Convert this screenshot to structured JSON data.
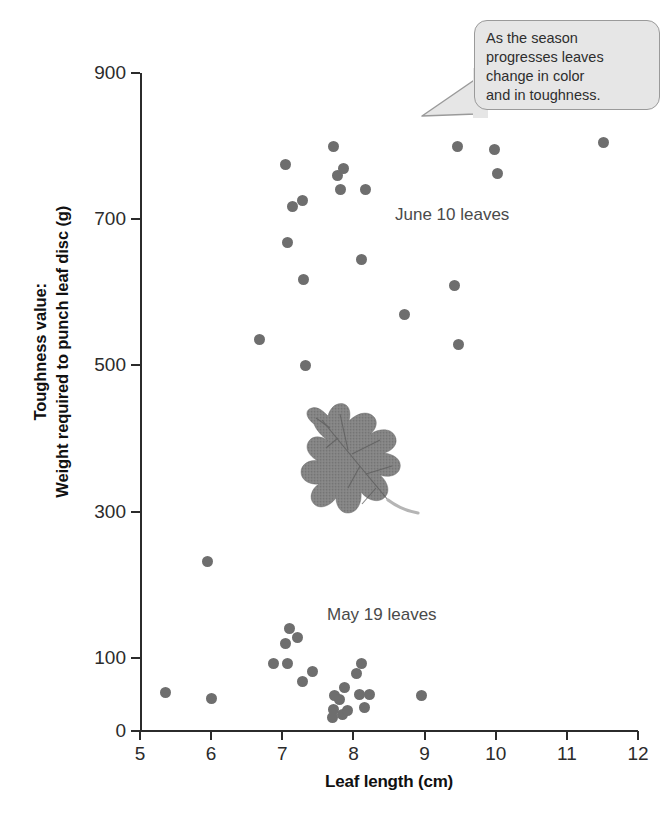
{
  "chart_data": {
    "type": "scatter",
    "title": "",
    "xlabel": "Leaf length (cm)",
    "ylabel_line1": "Toughness value:",
    "ylabel_line2": "Weight required to punch leaf disc (g)",
    "xlim": [
      5,
      12
    ],
    "ylim": [
      0,
      900
    ],
    "xticks": [
      "5",
      "6",
      "7",
      "8",
      "9",
      "10",
      "11",
      "12"
    ],
    "xtick_values": [
      5,
      6,
      7,
      8,
      9,
      10,
      11,
      12
    ],
    "yticks": [
      "0",
      "100",
      "300",
      "500",
      "700",
      "900"
    ],
    "ytick_values": [
      0,
      100,
      300,
      500,
      700,
      900
    ],
    "grid": false,
    "legend_position": "inline-annotations",
    "marker_color": "#6e6e6e",
    "series": [
      {
        "name": "June 10 leaves",
        "label_x": 8.55,
        "label_y": 722,
        "points": [
          [
            6.68,
            535
          ],
          [
            7.05,
            775
          ],
          [
            7.07,
            668
          ],
          [
            7.15,
            718
          ],
          [
            7.28,
            725
          ],
          [
            7.3,
            618
          ],
          [
            7.32,
            500
          ],
          [
            7.72,
            800
          ],
          [
            7.78,
            760
          ],
          [
            7.82,
            740
          ],
          [
            7.86,
            770
          ],
          [
            8.12,
            645
          ],
          [
            8.17,
            740
          ],
          [
            8.72,
            570
          ],
          [
            9.42,
            610
          ],
          [
            9.46,
            800
          ],
          [
            9.48,
            528
          ],
          [
            9.98,
            795
          ],
          [
            10.02,
            762
          ],
          [
            11.52,
            805
          ]
        ]
      },
      {
        "name": "May 19 leaves",
        "label_x": 7.68,
        "label_y": 178,
        "points": [
          [
            5.36,
            52
          ],
          [
            6.0,
            45
          ],
          [
            5.95,
            232
          ],
          [
            6.88,
            92
          ],
          [
            7.05,
            120
          ],
          [
            7.08,
            93
          ],
          [
            7.1,
            140
          ],
          [
            7.22,
            128
          ],
          [
            7.28,
            68
          ],
          [
            7.42,
            82
          ],
          [
            7.7,
            18
          ],
          [
            7.72,
            30
          ],
          [
            7.74,
            48
          ],
          [
            7.8,
            43
          ],
          [
            7.84,
            22
          ],
          [
            7.88,
            60
          ],
          [
            7.92,
            28
          ],
          [
            8.05,
            78
          ],
          [
            8.08,
            50
          ],
          [
            8.12,
            92
          ],
          [
            8.16,
            32
          ],
          [
            8.22,
            50
          ],
          [
            8.95,
            48
          ]
        ]
      }
    ],
    "annotations": [
      {
        "name": "season-callout",
        "text": "As the season progresses leaves change in color and in toughness.",
        "lines": [
          "As the season",
          "progresses leaves",
          "change in color",
          "and in toughness."
        ]
      }
    ]
  },
  "callout": {
    "line1": "As the season",
    "line2": "progresses leaves",
    "line3": "change in color",
    "line4": "and in toughness."
  },
  "axes": {
    "y_title_line1": "Toughness value:",
    "y_title_line2": "Weight required to punch leaf disc (g)",
    "x_title": "Leaf length (cm)"
  },
  "labels": {
    "june": "June 10 leaves",
    "may": "May 19 leaves"
  },
  "caption": {
    "partial": ""
  },
  "colors": {
    "marker": "#6e6e6e",
    "axis": "#2b2b2b",
    "callout_fill": "#e6e6e6",
    "callout_border": "#9a9a9a",
    "leaf": "#7a7a7a"
  }
}
